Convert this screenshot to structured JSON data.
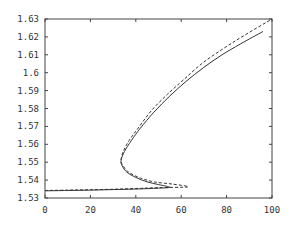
{
  "chart_data": {
    "type": "line",
    "title": "",
    "xlabel": "",
    "ylabel": "",
    "xlim": [
      0,
      100
    ],
    "ylim": [
      1.53,
      1.63
    ],
    "grid": false,
    "legend": null,
    "x_ticks": [
      0,
      20,
      40,
      60,
      80,
      100
    ],
    "x_tick_labels": [
      "0",
      "20",
      "40",
      "60",
      "80",
      "100"
    ],
    "y_ticks": [
      1.53,
      1.54,
      1.55,
      1.56,
      1.57,
      1.58,
      1.59,
      1.6,
      1.61,
      1.62,
      1.63
    ],
    "y_tick_labels": [
      "1.53",
      "1.54",
      "1.55",
      "1.56",
      "1.57",
      "1.58",
      "1.59",
      "1.6",
      "1.61",
      "1.62",
      "1.63"
    ],
    "series": [
      {
        "name": "solid",
        "style": "solid",
        "color": "#333333",
        "points": [
          [
            0,
            1.534
          ],
          [
            10,
            1.5342
          ],
          [
            20,
            1.5344
          ],
          [
            30,
            1.5347
          ],
          [
            40,
            1.535
          ],
          [
            50,
            1.5355
          ],
          [
            55,
            1.536
          ],
          [
            50,
            1.5375
          ],
          [
            45,
            1.539
          ],
          [
            40,
            1.5415
          ],
          [
            36,
            1.5445
          ],
          [
            34,
            1.548
          ],
          [
            33.5,
            1.551
          ],
          [
            35,
            1.556
          ],
          [
            38,
            1.562
          ],
          [
            42,
            1.569
          ],
          [
            48,
            1.578
          ],
          [
            55,
            1.587
          ],
          [
            62,
            1.595
          ],
          [
            70,
            1.603
          ],
          [
            78,
            1.61
          ],
          [
            86,
            1.616
          ],
          [
            96,
            1.623
          ]
        ]
      },
      {
        "name": "dashed",
        "style": "dashed",
        "color": "#333333",
        "points": [
          [
            0,
            1.5342
          ],
          [
            10,
            1.5344
          ],
          [
            20,
            1.5346
          ],
          [
            30,
            1.5349
          ],
          [
            40,
            1.5353
          ],
          [
            50,
            1.5358
          ],
          [
            63,
            1.5362
          ],
          [
            56,
            1.5378
          ],
          [
            48,
            1.539
          ],
          [
            42,
            1.5412
          ],
          [
            37,
            1.5443
          ],
          [
            34.5,
            1.5478
          ],
          [
            33.5,
            1.551
          ],
          [
            34.5,
            1.556
          ],
          [
            37,
            1.562
          ],
          [
            41,
            1.569
          ],
          [
            47,
            1.579
          ],
          [
            54,
            1.588
          ],
          [
            61,
            1.596
          ],
          [
            69,
            1.605
          ],
          [
            78,
            1.613
          ],
          [
            88,
            1.621
          ],
          [
            100,
            1.63
          ]
        ]
      }
    ]
  }
}
